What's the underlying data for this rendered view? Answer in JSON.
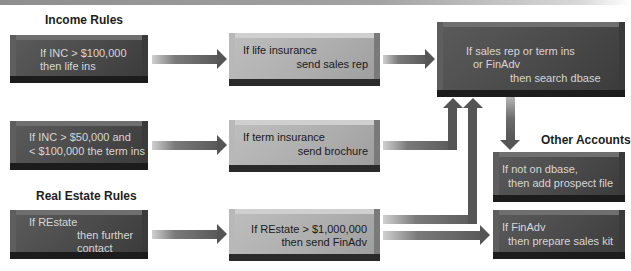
{
  "sections": {
    "income": "Income Rules",
    "real_estate": "Real Estate Rules",
    "other": "Other Accounts"
  },
  "rules": {
    "income_100k": {
      "line1": "If INC > $100,000",
      "line2": "then life ins"
    },
    "income_50k": {
      "line1": "If INC > $50,000 and",
      "line2": "< $100,000 the term ins"
    },
    "restate": {
      "line1": "If REstate",
      "line2": "then further",
      "line3": "contact"
    },
    "life_ins": {
      "line1": "If life insurance",
      "line2": "send sales rep"
    },
    "term_ins": {
      "line1": "If term insurance",
      "line2": "send brochure"
    },
    "restate_1m": {
      "line1": "If REstate > $1,000,000",
      "line2": "then send FinAdv"
    },
    "search_dbase": {
      "line1": "If sales rep or term ins",
      "line2": "or FinAdv",
      "line3": "then search dbase"
    },
    "not_on_dbase": {
      "line1": "If not on dbase,",
      "line2": "then add prospect file"
    },
    "finadv": {
      "line1": "If FinAdv",
      "line2": "then prepare sales kit"
    }
  },
  "colors": {
    "dark_box": "#4b4b4b",
    "light_box": "#adadad",
    "arrow": "#555555",
    "label": "#1e1e1e"
  }
}
